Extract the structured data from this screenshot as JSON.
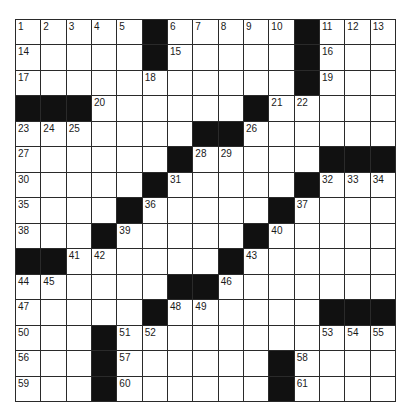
{
  "puzzle": {
    "rows": 15,
    "cols": 15,
    "colors": {
      "block": "#111111",
      "cell": "#ffffff",
      "line": "#2a2a2a"
    },
    "grid": [
      [
        "1",
        "2",
        "3",
        "4",
        "5",
        "#",
        "6",
        "7",
        "8",
        "9",
        "10",
        "#",
        "11",
        "12",
        "13"
      ],
      [
        "14",
        "",
        "",
        "",
        "",
        "#",
        "15",
        "",
        "",
        "",
        "",
        "#",
        "16",
        "",
        ""
      ],
      [
        "17",
        "",
        "",
        "",
        "",
        "18",
        "",
        "",
        "",
        "",
        "",
        "#",
        "19",
        "",
        ""
      ],
      [
        "#",
        "#",
        "#",
        "20",
        "",
        "",
        "",
        "",
        "",
        "#",
        "21",
        "22",
        "",
        "",
        ""
      ],
      [
        "23",
        "24",
        "25",
        "",
        "",
        "",
        "",
        "#",
        "#",
        "26",
        "",
        "",
        "",
        "",
        ""
      ],
      [
        "27",
        "",
        "",
        "",
        "",
        "",
        "#",
        "28",
        "29",
        "",
        "",
        "",
        "#",
        "#",
        "#"
      ],
      [
        "30",
        "",
        "",
        "",
        "",
        "#",
        "31",
        "",
        "",
        "",
        "",
        "#",
        "32",
        "33",
        "34"
      ],
      [
        "35",
        "",
        "",
        "",
        "#",
        "36",
        "",
        "",
        "",
        "",
        "#",
        "37",
        "",
        "",
        ""
      ],
      [
        "38",
        "",
        "",
        "#",
        "39",
        "",
        "",
        "",
        "",
        "#",
        "40",
        "",
        "",
        "",
        ""
      ],
      [
        "#",
        "#",
        "41",
        "42",
        "",
        "",
        "",
        "",
        "#",
        "43",
        "",
        "",
        "",
        "",
        ""
      ],
      [
        "44",
        "45",
        "",
        "",
        "",
        "",
        "#",
        "#",
        "46",
        "",
        "",
        "",
        "",
        "",
        ""
      ],
      [
        "47",
        "",
        "",
        "",
        "",
        "#",
        "48",
        "49",
        "",
        "",
        "",
        "",
        "#",
        "#",
        "#"
      ],
      [
        "50",
        "",
        "",
        "#",
        "51",
        "52",
        "",
        "",
        "",
        "",
        "",
        "",
        "53",
        "54",
        "55"
      ],
      [
        "56",
        "",
        "",
        "#",
        "57",
        "",
        "",
        "",
        "",
        "",
        "#",
        "58",
        "",
        "",
        ""
      ],
      [
        "59",
        "",
        "",
        "#",
        "60",
        "",
        "",
        "",
        "",
        "",
        "#",
        "61",
        "",
        "",
        ""
      ]
    ]
  }
}
